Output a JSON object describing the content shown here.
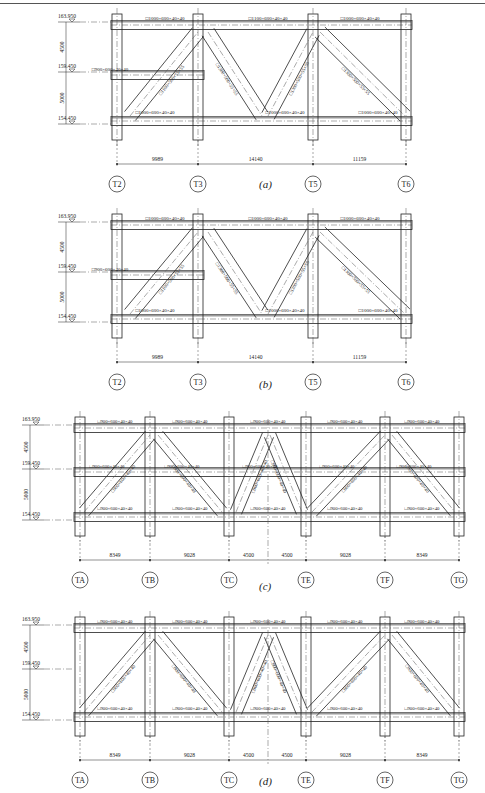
{
  "header": {
    "text": ""
  },
  "figures": [
    {
      "id": "a",
      "caption": "(a)",
      "elevations": [
        "163.950",
        "159.450",
        "154.450"
      ],
      "level_dims": [
        "4500",
        "5000"
      ],
      "axes": [
        "T2",
        "T3",
        "T5",
        "T6"
      ],
      "spans": [
        "9989",
        "14140",
        "11159"
      ],
      "top_chords": [
        "□1000×600×40×40",
        "□1100×600×40×40",
        "□1000×600×40×40"
      ],
      "mid_chord": "□900×600×40×40",
      "bottom_chords": [
        "□1000×600×40×40",
        "□1000×600×40×40",
        "□1000×600×40×40"
      ],
      "diagonals": [
        "□1100×500×55×55",
        "□1300×500×55×55",
        "□1300×500×55×55",
        "□1300×500×55×55"
      ]
    },
    {
      "id": "b",
      "caption": "(b)",
      "elevations": [
        "163.950",
        "159.450",
        "154.450"
      ],
      "level_dims": [
        "4500",
        "5000"
      ],
      "axes": [
        "T2",
        "T3",
        "T5",
        "T6"
      ],
      "spans": [
        "9989",
        "14140",
        "11159"
      ],
      "top_chords": [
        "□1000×600×40×40",
        "□1000×600×40×40",
        "□1000×600×40×40"
      ],
      "mid_chord": "□900×600×40×40",
      "bottom_chords": [
        "□1000×600×40×40",
        "□1000×600×40×40",
        "□1000×600×40×40"
      ],
      "diagonals": [
        "□1100×500×55×55",
        "□1300×500×55×55",
        "□1300×500×55×55",
        "□1300×500×55×55"
      ]
    },
    {
      "id": "c",
      "caption": "(c)",
      "elevations": [
        "163.950",
        "159.450",
        "154.450"
      ],
      "level_dims": [
        "4500",
        "5000"
      ],
      "axes": [
        "TA",
        "TB",
        "TC",
        "TE",
        "TF",
        "TG"
      ],
      "spans": [
        "8349",
        "9028",
        "4500",
        "4500",
        "9028",
        "8349"
      ],
      "top_chords": [
        "□900×600×40×40",
        "□900×600×40×40",
        "□900×600×40×40",
        "□900×600×40×40",
        "□900×600×40×40"
      ],
      "mid_chords": [
        "□900×600×40×40",
        "□900×600×40×40",
        "□900×600×40×40",
        "□900×600×40×40",
        "□900×600×40×40"
      ],
      "bottom_chords": [
        "□900×600×40×40",
        "□900×600×40×40",
        "□900×600×40×40",
        "□900×600×40×40",
        "□900×600×40×40"
      ],
      "diagonals": [
        "□900×600×40×40",
        "□900×600×40×40",
        "□900×600×40×40",
        "□900×600×40×40",
        "□900×600×40×40",
        "□900×600×40×40"
      ]
    },
    {
      "id": "d",
      "caption": "(d)",
      "elevations": [
        "163.950",
        "159.450",
        "154.450"
      ],
      "level_dims": [
        "4500",
        "5000"
      ],
      "axes": [
        "TA",
        "TB",
        "TC",
        "TE",
        "TF",
        "TG"
      ],
      "spans": [
        "8349",
        "9028",
        "4500",
        "4500",
        "9028",
        "8349"
      ],
      "top_chords": [
        "□900×600×40×40",
        "□900×600×40×40",
        "□900×600×40×40",
        "□900×600×40×40",
        "□900×600×40×40"
      ],
      "bottom_chords": [
        "□900×600×40×40",
        "□900×600×40×40",
        "□900×600×40×40",
        "□900×600×40×40",
        "□900×600×40×40"
      ],
      "diagonals": [
        "□900×600×40×40",
        "□900×600×40×40",
        "□900×600×40×40",
        "□900×600×40×40",
        "□900×600×40×40",
        "□900×600×40×40"
      ]
    }
  ]
}
